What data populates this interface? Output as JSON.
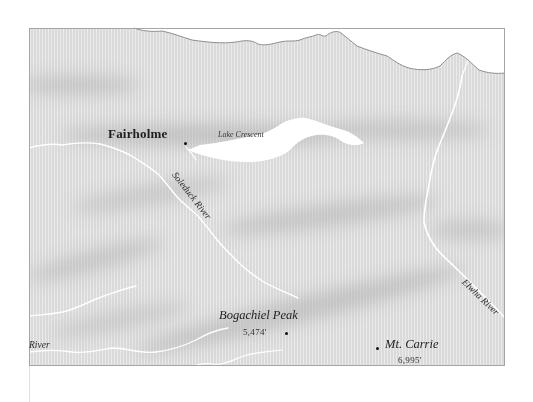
{
  "map": {
    "type": "shaded-relief-map",
    "colors": {
      "land": "#d9d9d9",
      "land_light": "#ececec",
      "ridge_shadow": "#c4c4c4",
      "water": "#ffffff",
      "coastline": "#8a8a8a",
      "frame": "#9a9a9a",
      "text": "#1e1e1e"
    },
    "places": [
      {
        "name": "Fairholme",
        "kind": "town"
      },
      {
        "name": "Bogachiel Peak",
        "kind": "peak",
        "elevation": "5,474'"
      },
      {
        "name": "Mt. Carrie",
        "kind": "peak",
        "elevation": "6,995'"
      }
    ],
    "water_labels": [
      {
        "name": "Lake Crescent",
        "kind": "lake"
      },
      {
        "name": "Soleduck River",
        "kind": "river"
      },
      {
        "name": "Elwha River",
        "kind": "river"
      },
      {
        "name": "River",
        "kind": "river-partial"
      }
    ]
  }
}
